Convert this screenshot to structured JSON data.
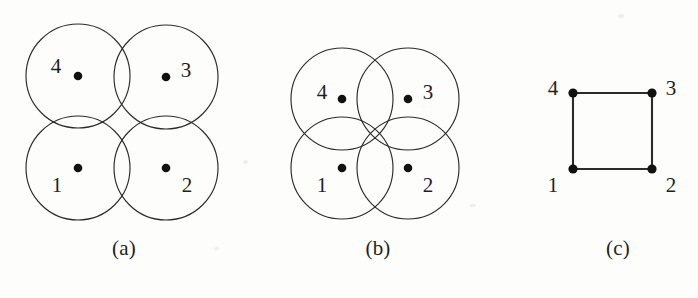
{
  "figure": {
    "kind": "unit-disk-graph-illustration",
    "background_color": "#fdfdfc",
    "ink_color": "#2b2b2b",
    "dot_color": "#111111",
    "panels": [
      {
        "id": "a",
        "caption": "(a)",
        "type": "disk-arrangement",
        "description": "Four circles in a 2x2 arrangement touching/slightly overlapping at the edges",
        "circle_radius": 52,
        "circles": [
          {
            "label": "1",
            "cx": 78,
            "cy": 168,
            "r": 52,
            "label_x": 58,
            "label_y": 185,
            "dot_x": 78,
            "dot_y": 168
          },
          {
            "label": "2",
            "cx": 166,
            "cy": 168,
            "r": 52,
            "label_x": 178,
            "label_y": 190,
            "dot_x": 166,
            "dot_y": 168
          },
          {
            "label": "3",
            "cx": 166,
            "cy": 77,
            "r": 52,
            "label_x": 178,
            "label_y": 73,
            "dot_x": 166,
            "dot_y": 77
          },
          {
            "label": "4",
            "cx": 78,
            "cy": 76,
            "r": 52,
            "label_x": 56,
            "label_y": 73,
            "dot_x": 78,
            "dot_y": 76
          }
        ]
      },
      {
        "id": "b",
        "caption": "(b)",
        "type": "disk-arrangement",
        "description": "Four larger overlapping circles in a 2x2 arrangement, all four overlapping near the centre",
        "circle_radius": 51,
        "circles": [
          {
            "label": "1",
            "cx": 342,
            "cy": 168,
            "r": 51,
            "label_x": 325,
            "label_y": 188,
            "dot_x": 342,
            "dot_y": 168
          },
          {
            "label": "2",
            "cx": 408,
            "cy": 168,
            "r": 51,
            "label_x": 419,
            "label_y": 188,
            "dot_x": 408,
            "dot_y": 168
          },
          {
            "label": "3",
            "cx": 408,
            "cy": 99,
            "r": 51,
            "label_x": 420,
            "label_y": 96,
            "dot_x": 408,
            "dot_y": 99
          },
          {
            "label": "4",
            "cx": 342,
            "cy": 99,
            "r": 51,
            "label_x": 322,
            "label_y": 96,
            "dot_x": 342,
            "dot_y": 99
          }
        ]
      },
      {
        "id": "c",
        "caption": "(c)",
        "type": "graph",
        "description": "Square graph on four vertices with edges 1-2, 2-3, 3-4, 4-1",
        "vertices": [
          {
            "label": "1",
            "x": 573,
            "y": 169,
            "label_x": 556,
            "label_y": 188
          },
          {
            "label": "2",
            "x": 652,
            "y": 169,
            "label_x": 661,
            "label_y": 188
          },
          {
            "label": "3",
            "x": 652,
            "y": 93,
            "label_x": 661,
            "label_y": 91
          },
          {
            "label": "4",
            "x": 573,
            "y": 93,
            "label_x": 554,
            "label_y": 91
          }
        ],
        "edges": [
          {
            "from": "4",
            "to": "3"
          },
          {
            "from": "1",
            "to": "2"
          },
          {
            "from": "1",
            "to": "4"
          },
          {
            "from": "2",
            "to": "3"
          }
        ]
      }
    ]
  }
}
